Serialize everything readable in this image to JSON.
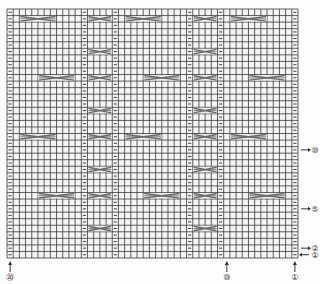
{
  "chart_data": {
    "type": "knitting-chart",
    "title": "",
    "grid": {
      "columns": 47,
      "rows": 38
    },
    "purl_columns": [
      0,
      12,
      17,
      29,
      34,
      46
    ],
    "symbols": {
      "purl": "−",
      "knit": "□",
      "cable_cross": "X"
    },
    "cables": [
      {
        "row": 1,
        "col_start": 2,
        "width": 6
      },
      {
        "row": 1,
        "col_start": 13,
        "width": 4
      },
      {
        "row": 1,
        "col_start": 19,
        "width": 6
      },
      {
        "row": 1,
        "col_start": 30,
        "width": 4
      },
      {
        "row": 1,
        "col_start": 36,
        "width": 6
      },
      {
        "row": 6,
        "col_start": 13,
        "width": 4
      },
      {
        "row": 6,
        "col_start": 30,
        "width": 4
      },
      {
        "row": 10,
        "col_start": 5,
        "width": 6
      },
      {
        "row": 10,
        "col_start": 13,
        "width": 4
      },
      {
        "row": 10,
        "col_start": 22,
        "width": 6
      },
      {
        "row": 10,
        "col_start": 30,
        "width": 4
      },
      {
        "row": 10,
        "col_start": 39,
        "width": 6
      },
      {
        "row": 15,
        "col_start": 13,
        "width": 4
      },
      {
        "row": 15,
        "col_start": 30,
        "width": 4
      },
      {
        "row": 19,
        "col_start": 2,
        "width": 6
      },
      {
        "row": 19,
        "col_start": 13,
        "width": 4
      },
      {
        "row": 19,
        "col_start": 19,
        "width": 6
      },
      {
        "row": 19,
        "col_start": 30,
        "width": 4
      },
      {
        "row": 19,
        "col_start": 36,
        "width": 6
      },
      {
        "row": 24,
        "col_start": 13,
        "width": 4
      },
      {
        "row": 24,
        "col_start": 30,
        "width": 4
      },
      {
        "row": 28,
        "col_start": 5,
        "width": 6
      },
      {
        "row": 28,
        "col_start": 13,
        "width": 4
      },
      {
        "row": 28,
        "col_start": 22,
        "width": 6
      },
      {
        "row": 28,
        "col_start": 30,
        "width": 4
      },
      {
        "row": 28,
        "col_start": 39,
        "width": 6
      },
      {
        "row": 33,
        "col_start": 13,
        "width": 4
      },
      {
        "row": 33,
        "col_start": 30,
        "width": 4
      }
    ],
    "row_labels": [
      {
        "text": "⑩",
        "row_from_bottom": 17,
        "arrow": "right"
      },
      {
        "text": "⑤",
        "row_from_bottom": 8,
        "arrow": "right"
      },
      {
        "text": "②",
        "row_from_bottom": 2,
        "arrow": "right"
      },
      {
        "text": "①",
        "row_from_bottom": 1,
        "arrow": "left"
      }
    ],
    "column_labels": [
      {
        "text": "⑳",
        "col": 0
      },
      {
        "text": "⑩",
        "col": 35
      },
      {
        "text": "①",
        "col": 46
      }
    ]
  },
  "colors": {
    "grid_line": "#3a3a3a",
    "cell_bg": "#f4f4f4",
    "cable": "#6a6a6a",
    "purl_mark": "#444444",
    "label": "#333333"
  }
}
